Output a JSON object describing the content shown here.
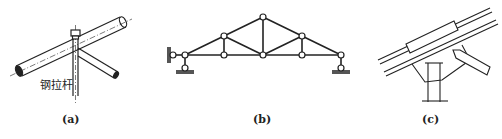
{
  "figures": [
    {
      "id": "a",
      "caption": "(a)",
      "label": "钢拉杆",
      "description": "Pipe members joined with steel tie rod"
    },
    {
      "id": "b",
      "caption": "(b)",
      "description": "Pin-jointed roof truss with supports"
    },
    {
      "id": "c",
      "caption": "(c)",
      "description": "Welded gusset plate connection of rafter, brace and column"
    }
  ],
  "colors": {
    "line": "#222222",
    "background": "#ffffff"
  }
}
